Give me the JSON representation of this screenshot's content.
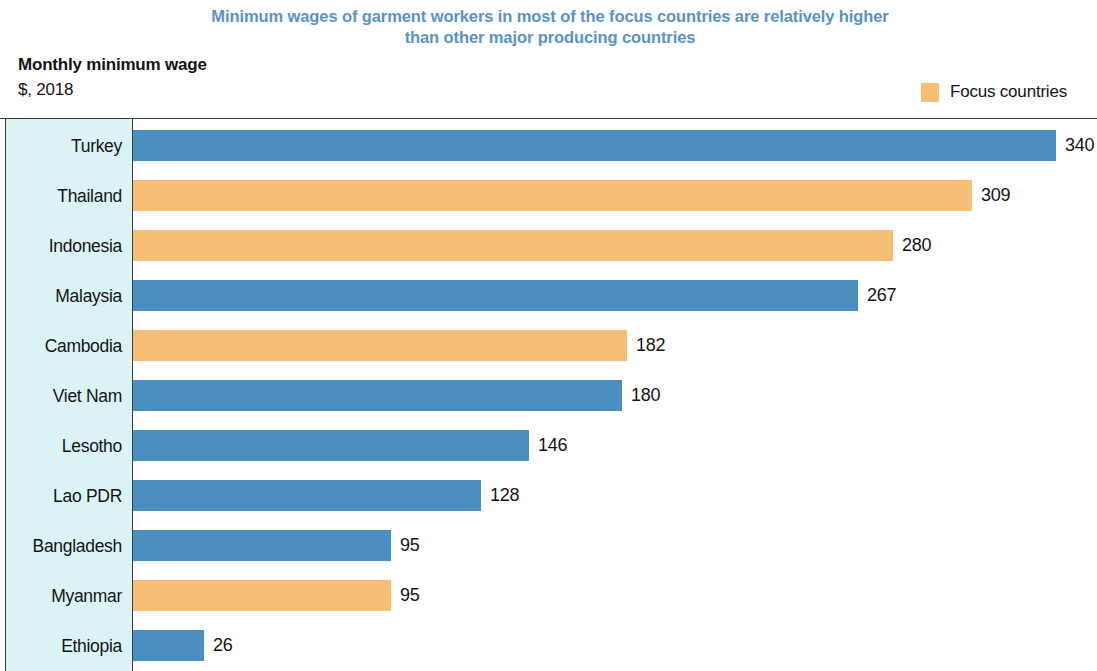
{
  "title": {
    "line1": "Minimum wages of garment workers in most of the focus countries are relatively higher",
    "line2": "than other major producing countries",
    "color": "#5892c6"
  },
  "axis_caption": {
    "main": "Monthly minimum wage",
    "sub": "$, 2018"
  },
  "legend": {
    "items": [
      {
        "label": "Focus countries",
        "color": "#f7bf76"
      }
    ]
  },
  "colors": {
    "focus": "#f7bf76",
    "other": "#4a8fc0",
    "category_panel_background": "#dcf3f6",
    "title_blue": "#5892c6",
    "frame_line": "#3c3c3c"
  },
  "chart_data": {
    "type": "bar",
    "orientation": "horizontal",
    "title": "Minimum wages of garment workers in most of the focus countries are relatively higher than other major producing countries",
    "subtitle": "Monthly minimum wage",
    "units": "$, 2018",
    "xlabel": "",
    "ylabel": "",
    "grid": false,
    "legend_position": "top-right",
    "xlim": [
      0,
      355
    ],
    "categories": [
      "Turkey",
      "Thailand",
      "Indonesia",
      "Malaysia",
      "Cambodia",
      "Viet Nam",
      "Lesotho",
      "Lao PDR",
      "Bangladesh",
      "Myanmar",
      "Ethiopia"
    ],
    "values": [
      340,
      309,
      280,
      267,
      182,
      180,
      146,
      128,
      95,
      95,
      26
    ],
    "value_labels": [
      "340",
      "309",
      "280",
      "267",
      "182",
      "180",
      "146",
      "128",
      "95",
      "95",
      "26"
    ],
    "focus_flags": [
      false,
      true,
      true,
      false,
      true,
      false,
      false,
      false,
      false,
      true,
      false
    ],
    "series": [
      {
        "name": "Monthly minimum wage",
        "values": [
          340,
          309,
          280,
          267,
          182,
          180,
          146,
          128,
          95,
          95,
          26
        ]
      }
    ],
    "legend_entries": [
      "Focus countries"
    ]
  }
}
